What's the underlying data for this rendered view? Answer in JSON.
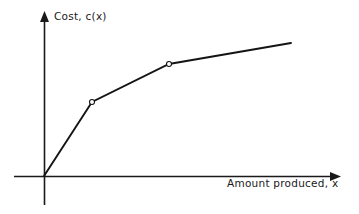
{
  "figure": {
    "background_color": "#ffffff",
    "ink_color": "#141414",
    "width": 359,
    "height": 214
  },
  "axes": {
    "y_label": "Cost, c(x)",
    "x_label": "Amount produced, x",
    "origin_label": "origin",
    "y_axis_name": "cost-axis",
    "x_axis_name": "amount-produced-axis"
  },
  "chart_data": {
    "type": "line",
    "title": "",
    "subtitle": "",
    "xlabel": "Amount produced, x",
    "ylabel": "Cost, c(x)",
    "grid": false,
    "legend": null,
    "axes_style": "arrow-tipped, unlabeled ticks",
    "xlim": [
      0,
      1
    ],
    "ylim": [
      0,
      1
    ],
    "series": [
      {
        "name": "Cost curve c(x)",
        "x": [
          0.0,
          0.194,
          0.505,
          0.999
        ],
        "y": [
          0.0,
          0.552,
          0.836,
          0.992
        ],
        "points_px": [
          {
            "x": 44,
            "y": 176
          },
          {
            "x": 92,
            "y": 102
          },
          {
            "x": 169,
            "y": 64
          },
          {
            "x": 291,
            "y": 43
          }
        ],
        "markers_at": [
          1,
          2
        ],
        "marker_style": "open-circle",
        "color": "#141414"
      }
    ],
    "segments": [
      {
        "name": "segment-1",
        "from": 0,
        "to": 1,
        "slope_description": "steep"
      },
      {
        "name": "segment-2",
        "from": 1,
        "to": 2,
        "slope_description": "moderate"
      },
      {
        "name": "segment-3",
        "from": 2,
        "to": 3,
        "slope_description": "shallow"
      }
    ]
  }
}
